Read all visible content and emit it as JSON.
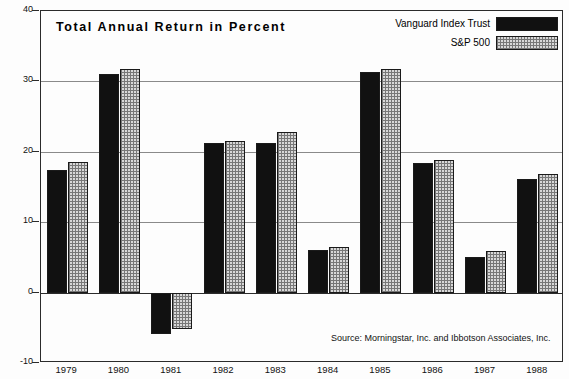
{
  "chart_data": {
    "type": "bar",
    "title": "Total Annual Return in Percent",
    "xlabel": "",
    "ylabel": "",
    "ylim": [
      -10,
      40
    ],
    "yticks": [
      40,
      30,
      20,
      10,
      0,
      -10
    ],
    "grid": true,
    "legend_position": "top-right",
    "categories": [
      "1979",
      "1980",
      "1981",
      "1982",
      "1983",
      "1984",
      "1985",
      "1986",
      "1987",
      "1988"
    ],
    "series": [
      {
        "name": "Vanguard Index Trust",
        "color": "#111111",
        "fill": "solid",
        "values": [
          17.4,
          31.1,
          -5.9,
          21.3,
          21.3,
          6.1,
          31.3,
          18.4,
          5.1,
          16.1
        ]
      },
      {
        "name": "S&P 500",
        "color": "#d8d8d8",
        "fill": "hatch",
        "values": [
          18.5,
          31.8,
          -5.2,
          21.6,
          22.8,
          6.5,
          31.8,
          18.8,
          5.9,
          16.8
        ]
      }
    ],
    "annotations": [
      "Source: Morningstar, Inc. and Ibbotson Associates, Inc."
    ]
  },
  "legend": {
    "items": [
      {
        "label": "Vanguard Index Trust",
        "swatch": "solid"
      },
      {
        "label": "S&P 500",
        "swatch": "hatch"
      }
    ]
  },
  "source_note": "Source: Morningstar, Inc. and Ibbotson Associates, Inc."
}
